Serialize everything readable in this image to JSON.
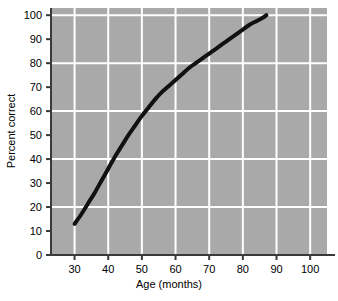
{
  "chart_data": {
    "type": "line",
    "title": "",
    "xlabel": "Age (months)",
    "ylabel": "Percent correct",
    "xlim": [
      23,
      105
    ],
    "ylim": [
      0,
      103
    ],
    "xticks": [
      30,
      40,
      50,
      60,
      70,
      80,
      90,
      100
    ],
    "xtick_labels": [
      "30",
      "40",
      "50",
      "60",
      "70",
      "80",
      "90",
      "100"
    ],
    "yticks": [
      0,
      10,
      20,
      30,
      40,
      50,
      60,
      70,
      80,
      90,
      100
    ],
    "ytick_labels": [
      "0",
      "10",
      "20",
      "30",
      "40",
      "50",
      "60",
      "70",
      "80",
      "90",
      "100"
    ],
    "grid": true,
    "grid_color": "#ffffff",
    "plot_background": "#a9a9a9",
    "line_color": "#111111",
    "line_width": 4,
    "legend": null,
    "series": [
      {
        "name": "Percent correct by age",
        "x": [
          30,
          32,
          34,
          36,
          38,
          40,
          42,
          44,
          46,
          48,
          50,
          52,
          54,
          56,
          58,
          60,
          62,
          64,
          66,
          68,
          70,
          72,
          74,
          76,
          78,
          80,
          82,
          84,
          86,
          87
        ],
        "y": [
          13,
          17,
          21.5,
          26,
          31,
          36,
          41,
          45.5,
          50,
          54,
          58,
          61.5,
          65,
          68,
          70.5,
          73,
          75.5,
          78,
          80,
          82,
          84,
          86,
          88,
          90,
          92,
          94,
          96,
          97.5,
          99,
          100
        ]
      }
    ]
  },
  "axes": {
    "x_axis_name": "x-axis",
    "y_axis_name": "y-axis"
  }
}
